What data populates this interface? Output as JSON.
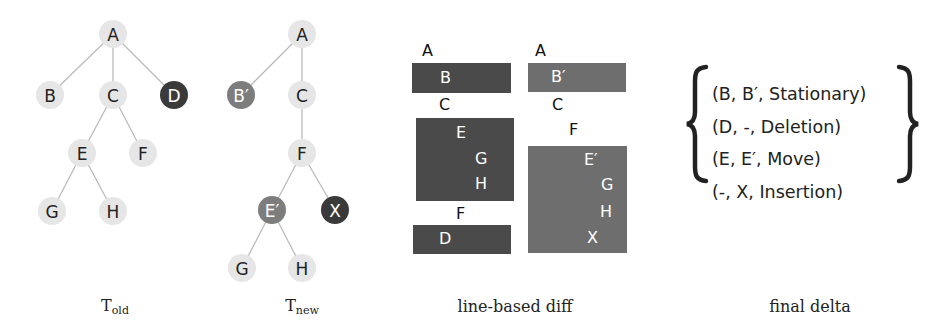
{
  "colors": {
    "node_unchanged": "#e6e6e6",
    "node_deleted": "#3a3a3a",
    "node_changed": "#7d7d7d",
    "diff_old_box": "#4a4a4a",
    "diff_new_box": "#6e6e6e",
    "edge": "#bbbbbb",
    "text_dark": "#222222",
    "text_light": "#ffffff"
  },
  "tree_old": {
    "caption_main": "T",
    "caption_sub": "old",
    "nodes": [
      {
        "id": "A",
        "label": "A",
        "x": 113,
        "y": 34,
        "status": "unchanged"
      },
      {
        "id": "B",
        "label": "B",
        "x": 50,
        "y": 95,
        "status": "unchanged"
      },
      {
        "id": "C",
        "label": "C",
        "x": 113,
        "y": 95,
        "status": "unchanged"
      },
      {
        "id": "D",
        "label": "D",
        "x": 174,
        "y": 95,
        "status": "deleted"
      },
      {
        "id": "E",
        "label": "E",
        "x": 82,
        "y": 153,
        "status": "unchanged"
      },
      {
        "id": "F",
        "label": "F",
        "x": 143,
        "y": 153,
        "status": "unchanged"
      },
      {
        "id": "G",
        "label": "G",
        "x": 52,
        "y": 211,
        "status": "unchanged"
      },
      {
        "id": "H",
        "label": "H",
        "x": 113,
        "y": 211,
        "status": "unchanged"
      }
    ],
    "edges": [
      [
        "A",
        "B"
      ],
      [
        "A",
        "C"
      ],
      [
        "A",
        "D"
      ],
      [
        "C",
        "E"
      ],
      [
        "C",
        "F"
      ],
      [
        "E",
        "G"
      ],
      [
        "E",
        "H"
      ]
    ]
  },
  "tree_new": {
    "caption_main": "T",
    "caption_sub": "new",
    "nodes": [
      {
        "id": "A",
        "label": "A",
        "x": 302,
        "y": 34,
        "status": "unchanged"
      },
      {
        "id": "B",
        "label": "B′",
        "x": 241,
        "y": 95,
        "status": "changed"
      },
      {
        "id": "C",
        "label": "C",
        "x": 302,
        "y": 95,
        "status": "unchanged"
      },
      {
        "id": "F",
        "label": "F",
        "x": 302,
        "y": 153,
        "status": "unchanged"
      },
      {
        "id": "E",
        "label": "E′",
        "x": 272,
        "y": 210,
        "status": "changed"
      },
      {
        "id": "X",
        "label": "X",
        "x": 335,
        "y": 210,
        "status": "inserted"
      },
      {
        "id": "G",
        "label": "G",
        "x": 242,
        "y": 268,
        "status": "unchanged"
      },
      {
        "id": "H",
        "label": "H",
        "x": 302,
        "y": 268,
        "status": "unchanged"
      }
    ],
    "edges": [
      [
        "A",
        "B"
      ],
      [
        "A",
        "C"
      ],
      [
        "C",
        "F"
      ],
      [
        "F",
        "E"
      ],
      [
        "F",
        "X"
      ],
      [
        "E",
        "G"
      ],
      [
        "E",
        "H"
      ]
    ]
  },
  "line_diff": {
    "caption": "line-based diff",
    "old_column": {
      "plain_lines": [
        {
          "text": "A",
          "x": 422,
          "y": 43
        },
        {
          "text": "C",
          "x": 439,
          "y": 97
        },
        {
          "text": "F",
          "x": 456,
          "y": 206
        }
      ],
      "boxes": [
        {
          "x": 412,
          "y": 63,
          "w": 99,
          "h": 30,
          "lines": [
            {
              "text": "B",
              "dx": 28,
              "dy": 7
            }
          ]
        },
        {
          "x": 416,
          "y": 118,
          "w": 98,
          "h": 83,
          "lines": [
            {
              "text": "E",
              "dx": 40,
              "dy": 7
            },
            {
              "text": "G",
              "dx": 59,
              "dy": 33
            },
            {
              "text": "H",
              "dx": 59,
              "dy": 58
            }
          ]
        },
        {
          "x": 413,
          "y": 225,
          "w": 98,
          "h": 29,
          "lines": [
            {
              "text": "D",
              "dx": 26,
              "dy": 6
            }
          ]
        }
      ]
    },
    "new_column": {
      "plain_lines": [
        {
          "text": "A",
          "x": 535,
          "y": 43
        },
        {
          "text": "C",
          "x": 552,
          "y": 97
        },
        {
          "text": "F",
          "x": 569,
          "y": 122
        }
      ],
      "boxes": [
        {
          "x": 528,
          "y": 63,
          "w": 98,
          "h": 29,
          "lines": [
            {
              "text": "B′",
              "dx": 23,
              "dy": 6
            }
          ]
        },
        {
          "x": 528,
          "y": 146,
          "w": 99,
          "h": 107,
          "lines": [
            {
              "text": "E′",
              "dx": 56,
              "dy": 6
            },
            {
              "text": "G",
              "dx": 73,
              "dy": 31
            },
            {
              "text": "H",
              "dx": 72,
              "dy": 58
            },
            {
              "text": "X",
              "dx": 59,
              "dy": 84
            }
          ]
        }
      ]
    }
  },
  "final_delta": {
    "caption": "final delta",
    "tuples": [
      "(B, B′, Stationary)",
      "(D, -, Deletion)",
      "(E, E′, Move)",
      "(-, X, Insertion)"
    ]
  }
}
